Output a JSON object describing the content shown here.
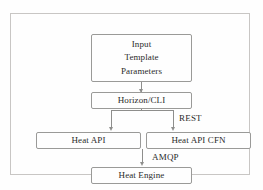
{
  "diagram": {
    "nodes": [
      {
        "id": "input-template-parameters",
        "lines": [
          "Input",
          "Template",
          "Parameters"
        ]
      },
      {
        "id": "horizon-cli",
        "lines": [
          "Horizon/CLI"
        ]
      },
      {
        "id": "heat-api",
        "lines": [
          "Heat API"
        ]
      },
      {
        "id": "heat-api-cfn",
        "lines": [
          "Heat API CFN"
        ]
      },
      {
        "id": "heat-engine",
        "lines": [
          "Heat Engine"
        ]
      }
    ],
    "edge_labels": {
      "rest": "REST",
      "amqp": "AMQP"
    },
    "colors": {
      "background": "#fefefe",
      "outer_border": "#c8c6c4",
      "node_border": "#9a9a98",
      "edge": "#8e8e8c",
      "text": "#2b2b2b"
    }
  }
}
